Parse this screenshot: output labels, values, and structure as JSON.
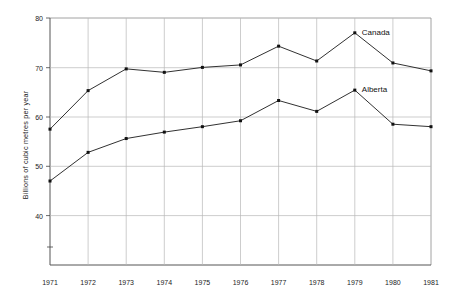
{
  "chart_data": {
    "type": "line",
    "title": "",
    "subtitle": "",
    "xlabel": "",
    "ylabel": "Billions of cubic metres per year",
    "categories": [
      1971,
      1972,
      1973,
      1974,
      1975,
      1976,
      1977,
      1978,
      1979,
      1980,
      1981
    ],
    "x_tick_labels": [
      "1971",
      "1972",
      "1973",
      "1974",
      "1975",
      "1976",
      "1977",
      "1978",
      "1979",
      "1980",
      "1981"
    ],
    "y_tick_labels": [
      "80",
      "70",
      "60",
      "50",
      "40"
    ],
    "y_ticks": [
      80,
      70,
      60,
      50,
      40
    ],
    "ylim": [
      33,
      80
    ],
    "xlim": [
      1971,
      1981
    ],
    "grid": true,
    "legend_position": "inline-right-of-last-point",
    "series": [
      {
        "name": "Canada",
        "label": "Canada",
        "color": "#111111",
        "values": [
          57.5,
          65.3,
          69.7,
          69.0,
          70.0,
          70.5,
          74.3,
          71.3,
          77.0,
          70.9,
          69.3
        ]
      },
      {
        "name": "Alberta",
        "label": "Alberta",
        "color": "#111111",
        "values": [
          47.0,
          52.8,
          55.6,
          56.9,
          58.0,
          59.2,
          63.3,
          61.1,
          65.4,
          58.5,
          58.0
        ]
      }
    ],
    "annotations": [
      {
        "text": "Canada",
        "anchor_year": 1979,
        "anchor_value": 77.0
      },
      {
        "text": "Alberta",
        "anchor_year": 1979,
        "anchor_value": 65.4
      }
    ]
  },
  "axis": {
    "y_label_text": "Billions of cubic metres per year"
  }
}
